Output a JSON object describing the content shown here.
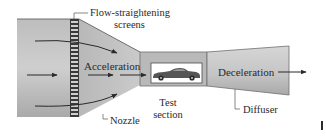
{
  "diagram": {
    "labels": {
      "screens_line1": "Flow-straightening",
      "screens_line2": "screens",
      "acceleration": "Acceleration",
      "nozzle": "Nozzle",
      "test_line1": "Test",
      "test_line2": "section",
      "deceleration": "Deceleration",
      "diffuser": "Diffuser"
    },
    "sections": [
      "settling chamber",
      "flow-straightening screens",
      "nozzle",
      "test section",
      "diffuser"
    ],
    "colors": {
      "body_fill_dark": "#9a9a9a",
      "body_fill_light": "#d2d2d2",
      "outline": "#6e6e6e",
      "text": "#2a2a2a",
      "window": "#ffffff"
    }
  }
}
